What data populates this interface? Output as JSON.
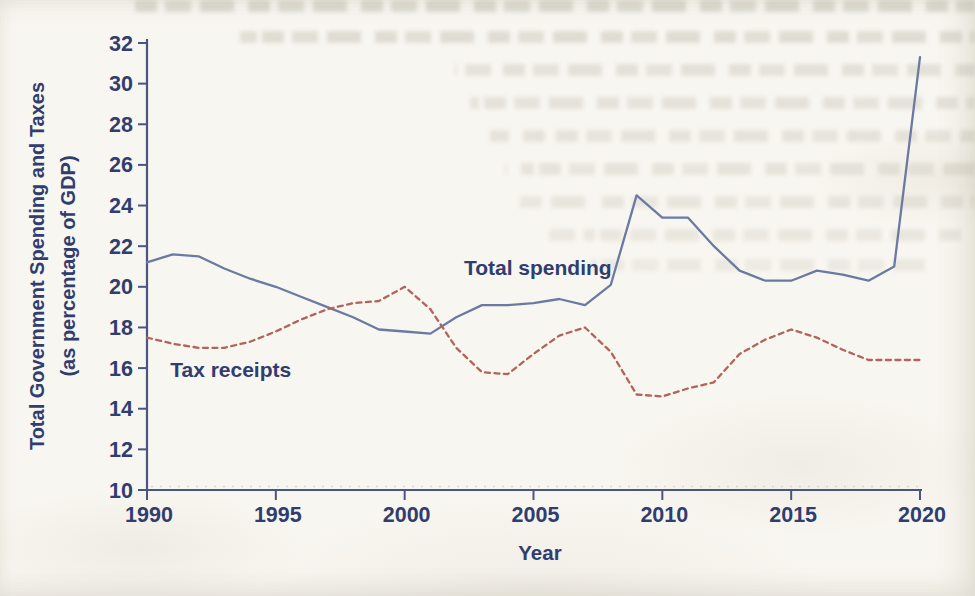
{
  "page": {
    "kind": "scanned textbook figure",
    "background_color": "#f8f6f0",
    "text_color": "#303d6f",
    "axis_color": "#4b5680"
  },
  "chart_data": {
    "type": "line",
    "title": "",
    "xlabel": "Year",
    "ylabel": "Total Government Spending and Taxes (as percentage of GDP)",
    "ylabel_lines": [
      "Total Government Spending and Taxes",
      "(as percentage of GDP)"
    ],
    "xlim": [
      1990,
      2020
    ],
    "ylim": [
      10,
      32
    ],
    "x_ticks": [
      1990,
      1995,
      2000,
      2005,
      2010,
      2015,
      2020
    ],
    "y_ticks": [
      10,
      12,
      14,
      16,
      18,
      20,
      22,
      24,
      26,
      28,
      30,
      32
    ],
    "grid": false,
    "legend_position": "inline annotations on plot",
    "x": [
      1990,
      1991,
      1992,
      1993,
      1994,
      1995,
      1996,
      1997,
      1998,
      1999,
      2000,
      2001,
      2002,
      2003,
      2004,
      2005,
      2006,
      2007,
      2008,
      2009,
      2010,
      2011,
      2012,
      2013,
      2014,
      2015,
      2016,
      2017,
      2018,
      2019,
      2020
    ],
    "series": [
      {
        "name": "Total spending",
        "color": "#6b7aa3",
        "line_style": "solid",
        "values": [
          21.2,
          21.6,
          21.5,
          20.9,
          20.4,
          20.0,
          19.5,
          19.0,
          18.5,
          17.9,
          17.8,
          17.7,
          18.5,
          19.1,
          19.1,
          19.2,
          19.4,
          19.1,
          20.1,
          24.5,
          23.4,
          23.4,
          22.0,
          20.8,
          20.3,
          20.3,
          20.8,
          20.6,
          20.3,
          21.0,
          31.3
        ]
      },
      {
        "name": "Tax receipts",
        "color": "#b2635b",
        "line_style": "dashed",
        "values": [
          17.5,
          17.2,
          17.0,
          17.0,
          17.3,
          17.8,
          18.4,
          18.9,
          19.2,
          19.3,
          20.0,
          18.9,
          17.0,
          15.8,
          15.7,
          16.7,
          17.6,
          18.0,
          16.8,
          14.7,
          14.6,
          15.0,
          15.3,
          16.7,
          17.4,
          17.9,
          17.5,
          16.9,
          16.4,
          16.4,
          16.4
        ]
      }
    ],
    "annotations": [
      {
        "text": "Total spending",
        "year": 2002.3,
        "value": 20.6
      },
      {
        "text": "Tax receipts",
        "year": 1990.9,
        "value": 15.55
      }
    ]
  }
}
